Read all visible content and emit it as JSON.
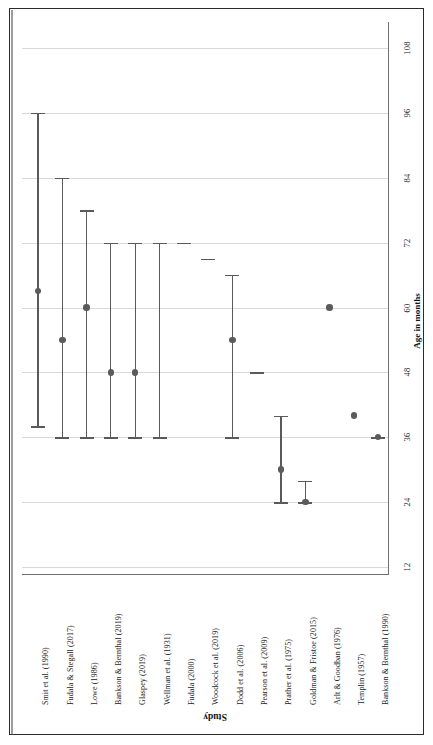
{
  "chart_data": {
    "type": "scatter",
    "title": "",
    "xlabel": "Study",
    "ylabel": "Age in months",
    "orientation": "rotated-90",
    "grid": true,
    "legend": "none",
    "ylim": [
      0,
      114
    ],
    "yticks": [
      12,
      24,
      36,
      48,
      60,
      72,
      84,
      96,
      108
    ],
    "ytick_labels": [
      "12",
      "24",
      "36",
      "48",
      "60",
      "72",
      "84",
      "96",
      "108"
    ],
    "categories": [
      "Smit et al. (1990)",
      "Fudala & Stegall (2017)",
      "Lowe (1986)",
      "Bankson & Bernthal (2019)",
      "Glaspey (2019)",
      "Wellman et al. (1931)",
      "Fudala (2000)",
      "Woodcock et al. (2019)",
      "Dodd et al. (2006)",
      "Pearson et al. (2009)",
      "Prather et al. (1975)",
      "Goldman & Fristoe (2015)",
      "Arlt & Goodban (1976)",
      "Templin (1957)",
      "Bankson & Bernthal (1990)"
    ],
    "points": [
      {
        "study": "Smit et al. (1990)",
        "value": 63,
        "low": 38,
        "high": 96
      },
      {
        "study": "Fudala & Stegall (2017)",
        "value": 54,
        "low": 36,
        "high": 84
      },
      {
        "study": "Lowe (1986)",
        "value": 60,
        "low": 36,
        "high": 78
      },
      {
        "study": "Bankson & Bernthal (2019)",
        "value": 48,
        "low": 36,
        "high": 72
      },
      {
        "study": "Glaspey (2019)",
        "value": 48,
        "low": 36,
        "high": 72
      },
      {
        "study": "Wellman et al. (1931)",
        "value": null,
        "low": 36,
        "high": 72
      },
      {
        "study": "Fudala (2000)",
        "value": null,
        "low": 72,
        "high": 72
      },
      {
        "study": "Woodcock et al. (2019)",
        "value": null,
        "low": 69,
        "high": 69
      },
      {
        "study": "Dodd et al. (2006)",
        "value": 54,
        "low": 36,
        "high": 66
      },
      {
        "study": "Pearson et al. (2009)",
        "value": null,
        "low": 48,
        "high": 48
      },
      {
        "study": "Prather et al. (1975)",
        "value": 30,
        "low": 24,
        "high": 40
      },
      {
        "study": "Goldman & Fristoe (2015)",
        "value": 24,
        "low": 24,
        "high": 28
      },
      {
        "study": "Arlt & Goodban (1976)",
        "value": 60,
        "low": null,
        "high": null
      },
      {
        "study": "Templin (1957)",
        "value": 40,
        "low": null,
        "high": null
      },
      {
        "study": "Bankson & Bernthal (1990)",
        "value": 36,
        "low": 36,
        "high": 36
      }
    ],
    "marker_color": "#5b5b5b",
    "grid_color": "#d9d9d9",
    "axis_color": "#6f6f6f"
  },
  "axes": {
    "value_axis_title": "Age in months",
    "category_axis_title": "Study"
  }
}
